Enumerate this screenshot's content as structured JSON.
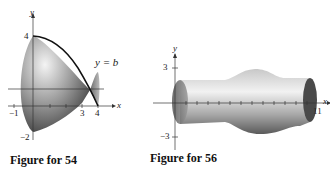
{
  "figures": [
    {
      "id": "fig54",
      "caption": "Figure for 54",
      "axis_x_label": "x",
      "axis_y_label": "y",
      "y_ticks": {
        "top": "4",
        "bottom": "−2"
      },
      "x_ticks": {
        "left": "−1",
        "t3": "3",
        "t4": "4"
      },
      "annotation": "y = b"
    },
    {
      "id": "fig56",
      "caption": "Figure for 56",
      "axis_x_label": "x",
      "axis_y_label": "y",
      "y_ticks": {
        "top": "3",
        "bottom": "−3"
      },
      "x_ticks": {
        "right": "11"
      }
    }
  ]
}
